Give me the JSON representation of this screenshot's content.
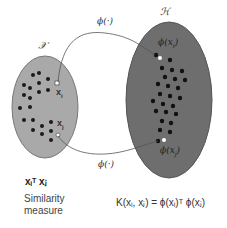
{
  "diagram": {
    "input_space": {
      "label": "𝒳",
      "fill": "#a9a9a9",
      "stroke": "#777777",
      "point_i_label": "x",
      "point_i_sub": "i",
      "point_j_label": "x",
      "point_j_sub": "j"
    },
    "feature_space": {
      "label": "ℋ",
      "fill": "#6e6e6e",
      "stroke": "#555555",
      "phi_i_label": "ϕ(x",
      "phi_i_sub": "i",
      "phi_j_label": "ϕ(x",
      "phi_j_sub": "j",
      "close": ")"
    },
    "mapping_top_label": "ϕ(·)",
    "mapping_bottom_label": "ϕ(·)",
    "dot_product_label": "xᵢᵀ xⱼ",
    "similarity_caption_line1": "Similarity",
    "similarity_caption_line2": "measure",
    "kernel_equation": "K(xᵢ, xⱼ) = ϕ(xᵢ)ᵀ ϕ(xⱼ)"
  }
}
